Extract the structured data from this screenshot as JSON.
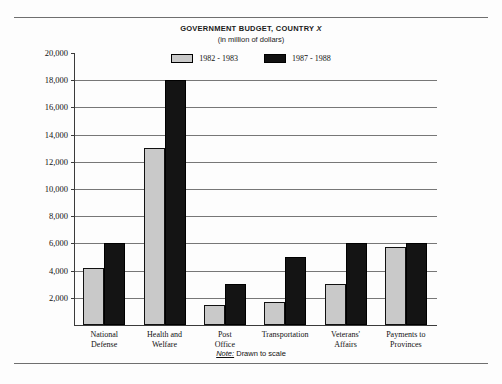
{
  "chart_data": {
    "type": "bar",
    "title": "GOVERNMENT BUDGET, COUNTRY X",
    "title_plain": "GOVERNMENT BUDGET, COUNTRY ",
    "title_italic": "X",
    "subtitle": "(in million of dollars)",
    "xlabel": "",
    "ylabel": "",
    "ylim": [
      0,
      20000
    ],
    "grid": true,
    "legend_position": "top-center",
    "categories": [
      "National Defense",
      "Health and Welfare",
      "Post Office",
      "Transportation",
      "Veterans' Affairs",
      "Payments to Provinces"
    ],
    "category_lines": [
      [
        "National",
        "Defense"
      ],
      [
        "Health and",
        "Welfare"
      ],
      [
        "Post",
        "Office"
      ],
      [
        "Transportation",
        ""
      ],
      [
        "Veterans'",
        "Affairs"
      ],
      [
        "Payments to",
        "Provinces"
      ]
    ],
    "series": [
      {
        "name": "1982 - 1983",
        "color": "#c9c9c9",
        "values": [
          4200,
          13000,
          1500,
          1700,
          3000,
          5700
        ]
      },
      {
        "name": "1987 - 1988",
        "color": "#141414",
        "values": [
          6000,
          18000,
          3000,
          5000,
          6000,
          6000
        ]
      }
    ],
    "yticks": [
      2000,
      4000,
      6000,
      8000,
      10000,
      12000,
      14000,
      16000,
      18000,
      20000
    ],
    "ytick_labels": [
      "2,000",
      "4,000",
      "6,000",
      "8,000",
      "10,000",
      "12,000",
      "14,000",
      "16,000",
      "18,000",
      "20,000"
    ],
    "note_prefix": "Note:",
    "note_text": " Drawn to scale"
  },
  "legend": {
    "items": [
      {
        "label": "1982 - 1983",
        "swatch": "light-gray"
      },
      {
        "label": "1987 - 1988",
        "swatch": "black"
      }
    ]
  }
}
